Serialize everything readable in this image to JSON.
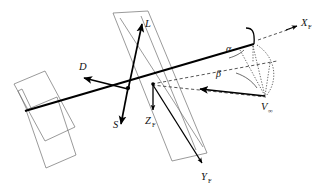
{
  "figure": {
    "type": "technical-line-diagram",
    "background_color": "#ffffff",
    "ink_color": "#000000",
    "panel_outline_color": "#6f6f6f"
  },
  "labels": {
    "lift": {
      "text": "L",
      "meaning": "lift-force-vector"
    },
    "drag": {
      "text": "D",
      "meaning": "drag-force-vector"
    },
    "side": {
      "text": "S",
      "meaning": "side-force-vector"
    },
    "x_axis": {
      "text": "X",
      "sub": "F",
      "meaning": "body-x-axis"
    },
    "y_axis": {
      "text": "Y",
      "sub": "F",
      "meaning": "body-y-axis"
    },
    "z_axis": {
      "text": "Z",
      "sub": "F",
      "meaning": "body-z-axis"
    },
    "velocity": {
      "text": "V",
      "sub": "∞",
      "meaning": "freestream-velocity-vector"
    },
    "alpha": {
      "text": "α",
      "meaning": "angle-of-attack"
    },
    "beta": {
      "text": "β",
      "meaning": "sideslip-angle"
    }
  },
  "geometry": {
    "origin": {
      "x": 128,
      "y": 88
    },
    "secondary_node": {
      "x": 153,
      "y": 84
    },
    "velocity_tail": {
      "x": 265,
      "y": 97
    },
    "x_axis_tip": {
      "x": 297,
      "y": 25
    },
    "vectors": {
      "lift": {
        "from": [
          128,
          88
        ],
        "to": [
          143,
          21
        ]
      },
      "drag": {
        "from": [
          128,
          88
        ],
        "to": [
          82,
          77
        ]
      },
      "side": {
        "from": [
          128,
          88
        ],
        "to": [
          121,
          127
        ]
      },
      "z_axis": {
        "from": [
          153,
          84
        ],
        "to": [
          153,
          113
        ]
      },
      "y_axis": {
        "from": [
          153,
          84
        ],
        "to": [
          203,
          166
        ]
      },
      "velocity": {
        "from": [
          265,
          97
        ],
        "to": [
          198,
          88
        ]
      }
    },
    "chord_line": {
      "from": [
        26,
        110
      ],
      "to": [
        253,
        44
      ]
    },
    "panels": [
      {
        "name": "left-wing-panel",
        "points": "15,84 44,72 74,128 45,145"
      },
      {
        "name": "left-wing-panel-lower",
        "points": "26,110 57,97 75,155 45,167"
      },
      {
        "name": "center-plate",
        "points": "114,14 148,12 206,152 173,160"
      },
      {
        "name": "center-plate-inner",
        "points": "120,18 151,16 200,146 175,154"
      }
    ]
  },
  "annotations": {
    "alpha_arc": "angle between chord/body-x and projected velocity",
    "beta_arc": "angle between projected velocity and freestream velocity",
    "dashed_projection": "projection construction lines for alpha and beta",
    "axis_hook": "small tick hook at body-x axis tip"
  }
}
